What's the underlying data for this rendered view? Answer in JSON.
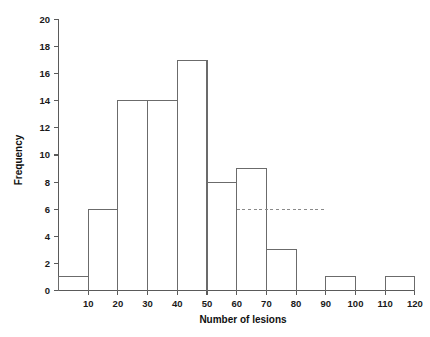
{
  "chart_data": {
    "type": "bar",
    "title": "",
    "xlabel": "Number of lesions",
    "ylabel": "Frequency",
    "xlim": [
      0,
      120
    ],
    "ylim": [
      0,
      20
    ],
    "grid": false,
    "legend": null,
    "bin_width": 10,
    "bin_edges": [
      0,
      10,
      20,
      30,
      40,
      50,
      60,
      70,
      80,
      90,
      100,
      110,
      120
    ],
    "categories": [
      "0-10",
      "10-20",
      "20-30",
      "30-40",
      "40-50",
      "50-60",
      "60-70",
      "70-80",
      "80-90",
      "90-100",
      "100-110",
      "110-120"
    ],
    "values": [
      1,
      6,
      14,
      14,
      17,
      8,
      9,
      3,
      0,
      1,
      0,
      1
    ],
    "xticks": [
      10,
      20,
      30,
      40,
      50,
      60,
      70,
      80,
      90,
      100,
      110,
      120
    ],
    "xticklabels": [
      "10",
      "20",
      "30",
      "40",
      "50",
      "60",
      "70",
      "80",
      "90",
      "100",
      "110",
      "120"
    ],
    "yticks": [
      0,
      2,
      4,
      6,
      8,
      10,
      12,
      14,
      16,
      18,
      20
    ],
    "yticklabels": [
      "0",
      "2",
      "4",
      "6",
      "8",
      "10",
      "12",
      "14",
      "16",
      "18",
      "20"
    ],
    "annotations": [
      {
        "name": "reference-line",
        "style": "dashed",
        "orientation": "horizontal",
        "y": 6,
        "x_start": 60,
        "x_end": 90
      }
    ]
  },
  "axes": {
    "y_title": "Frequency",
    "x_title": "Number of lesions"
  },
  "colors": {
    "background": "#ffffff",
    "axis": "#5a5a5a",
    "bar_stroke": "#6b6b6b",
    "dashed_line": "#8a8a8a",
    "text": "#101010"
  }
}
